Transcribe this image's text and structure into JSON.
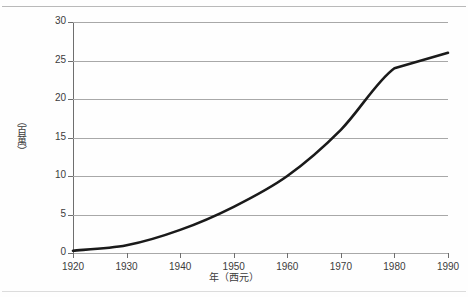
{
  "chart_data": {
    "type": "line",
    "title": "",
    "subtitle": "",
    "xlabel": "年（西元）",
    "ylabel": "（百萬）",
    "x": [
      1920,
      1930,
      1940,
      1950,
      1960,
      1970,
      1980,
      1990
    ],
    "categories": [
      "1920",
      "1930",
      "1940",
      "1950",
      "1960",
      "1970",
      "1980",
      "1990"
    ],
    "values": [
      0.3,
      1,
      3,
      6,
      10,
      16,
      24,
      26
    ],
    "series": [
      {
        "name": "",
        "values": [
          0.3,
          1,
          3,
          6,
          10,
          16,
          24,
          26
        ]
      }
    ],
    "xlim": [
      1920,
      1990
    ],
    "ylim": [
      0,
      30
    ],
    "ytick_values": [
      0,
      5,
      10,
      15,
      20,
      25,
      30
    ],
    "ytick_labels": [
      "0",
      "5",
      "10",
      "15",
      "20",
      "25",
      "30"
    ],
    "xtick_labels": [
      "1920",
      "1930",
      "1940",
      "1950",
      "1960",
      "1970",
      "1980",
      "1990"
    ],
    "grid": "horizontal",
    "legend": "none",
    "line_color": "#1a1a1a",
    "grid_color": "#a8a8a8",
    "axis_color": "#6e6e6e",
    "background_color": "#fefefe",
    "annotations": []
  },
  "axes": {
    "y_title_chars": [
      "（",
      "百",
      "萬",
      "）"
    ],
    "y_ticks": [
      {
        "label": "30",
        "value": 30
      },
      {
        "label": "25",
        "value": 25
      },
      {
        "label": "20",
        "value": 20
      },
      {
        "label": "15",
        "value": 15
      },
      {
        "label": "10",
        "value": 10
      },
      {
        "label": "5",
        "value": 5
      },
      {
        "label": "0",
        "value": 0
      }
    ],
    "x_ticks": [
      {
        "label": "1920",
        "value": 1920
      },
      {
        "label": "1930",
        "value": 1930
      },
      {
        "label": "1940",
        "value": 1940
      },
      {
        "label": "1950",
        "value": 1950
      },
      {
        "label": "1960",
        "value": 1960
      },
      {
        "label": "1970",
        "value": 1970
      },
      {
        "label": "1980",
        "value": 1980
      },
      {
        "label": "1990",
        "value": 1990
      }
    ]
  }
}
